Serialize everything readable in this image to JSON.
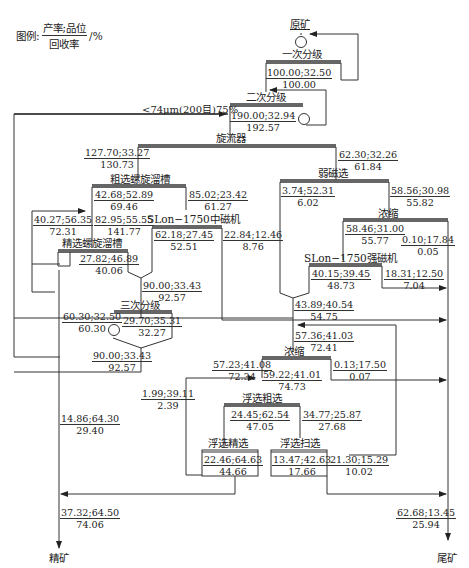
{
  "legend": {
    "prefix": "图例:",
    "numerator": "产率;品位",
    "denominator": "回收率",
    "unit": "/%"
  },
  "nodes": {
    "raw_ore": "原矿",
    "primary_classify": "一次分级",
    "secondary_classify": "二次分级",
    "cyclone": "旋流器",
    "weak_mag": "弱磁选",
    "rough_spiral": "粗选螺旋溜槽",
    "concentrate_thicken1": "浓缩",
    "slon_medium": "SLon−1750中磁机",
    "slon_strong": "SLon−1750强磁机",
    "clean_spiral": "精选螺旋溜槽",
    "tertiary_classify": "三次分级",
    "thicken2": "浓缩",
    "float_rough": "浮选粗选",
    "float_clean": "浮选精选",
    "float_scav": "浮选扫选",
    "concentrate": "精矿",
    "tailings": "尾矿"
  },
  "grind_note": "<74μm(200目)75%",
  "streams": [
    {
      "id": "s_primary",
      "yield_grade": "100.00;32.50",
      "recovery": "100.00"
    },
    {
      "id": "s_secondary",
      "yield_grade": "190.00;32.94",
      "recovery": "192.57"
    },
    {
      "id": "s_cyclone_uf",
      "yield_grade": "127.70;33.27",
      "recovery": "130.73"
    },
    {
      "id": "s_cyclone_of",
      "yield_grade": "62.30;32.26",
      "recovery": "61.84"
    },
    {
      "id": "s_rough_conc",
      "yield_grade": "42.68;52.89",
      "recovery": "69.46"
    },
    {
      "id": "s_rough_tail",
      "yield_grade": "85.02;23.42",
      "recovery": "61.27"
    },
    {
      "id": "s_clean_mid_return",
      "yield_grade": "40.27;56.35",
      "recovery": "72.31"
    },
    {
      "id": "s_clean_feed",
      "yield_grade": "82.95;55.55",
      "recovery": "141.77"
    },
    {
      "id": "s_clean_mid",
      "yield_grade": "27.82;46.89",
      "recovery": "40.06"
    },
    {
      "id": "s_medium_conc",
      "yield_grade": "62.18;27.45",
      "recovery": "52.51"
    },
    {
      "id": "s_medium_tail",
      "yield_grade": "22.84;12.46",
      "recovery": "8.76"
    },
    {
      "id": "s_weak_conc",
      "yield_grade": "3.74;52.31",
      "recovery": "6.02"
    },
    {
      "id": "s_weak_tail",
      "yield_grade": "58.56;30.98",
      "recovery": "55.82"
    },
    {
      "id": "s_thicken1_uf",
      "yield_grade": "58.46;31.00",
      "recovery": "55.77"
    },
    {
      "id": "s_thicken1_of",
      "yield_grade": "0.10;17.84",
      "recovery": "0.05"
    },
    {
      "id": "s_strong_conc",
      "yield_grade": "40.15;39.45",
      "recovery": "48.73"
    },
    {
      "id": "s_strong_tail",
      "yield_grade": "18.31;12.50",
      "recovery": "7.04"
    },
    {
      "id": "s_merge_mid",
      "yield_grade": "90.00;33.43",
      "recovery": "92.57"
    },
    {
      "id": "s_mag_conc",
      "yield_grade": "43.89;40.54",
      "recovery": "54.75"
    },
    {
      "id": "s_tert_uf",
      "yield_grade": "60.30;32.50",
      "recovery": "60.30"
    },
    {
      "id": "s_tert_of",
      "yield_grade": "29.70;35.31",
      "recovery": "32.27"
    },
    {
      "id": "s_tert_return",
      "yield_grade": "90.00;33.43",
      "recovery": "92.57"
    },
    {
      "id": "s_thicken2_feed",
      "yield_grade": "57.36;41.03",
      "recovery": "72.41"
    },
    {
      "id": "s_thicken2_uf",
      "yield_grade": "57.23;41.08",
      "recovery": "72.34"
    },
    {
      "id": "s_thicken2_of",
      "yield_grade": "0.13;17.50",
      "recovery": "0.07"
    },
    {
      "id": "s_float_feed",
      "yield_grade": "59.22;41.01",
      "recovery": "74.73"
    },
    {
      "id": "s_float_clean_mid",
      "yield_grade": "1.99;39.11",
      "recovery": "2.39"
    },
    {
      "id": "s_float_rough_conc",
      "yield_grade": "24.45;62.54",
      "recovery": "47.05"
    },
    {
      "id": "s_float_rough_tail",
      "yield_grade": "34.77;25.87",
      "recovery": "27.68"
    },
    {
      "id": "s_float_clean_conc",
      "yield_grade": "22.46;64.63",
      "recovery": "44.66"
    },
    {
      "id": "s_float_scav_conc",
      "yield_grade": "13.47;42.63",
      "recovery": "17.66"
    },
    {
      "id": "s_float_scav_tail",
      "yield_grade": "21.30;15.29",
      "recovery": "10.02"
    },
    {
      "id": "s_gravity_conc",
      "yield_grade": "14.86;64.30",
      "recovery": "29.40"
    },
    {
      "id": "s_final_conc",
      "yield_grade": "37.32;64.50",
      "recovery": "74.06"
    },
    {
      "id": "s_final_tail",
      "yield_grade": "62.68;13.45",
      "recovery": "25.94"
    }
  ]
}
